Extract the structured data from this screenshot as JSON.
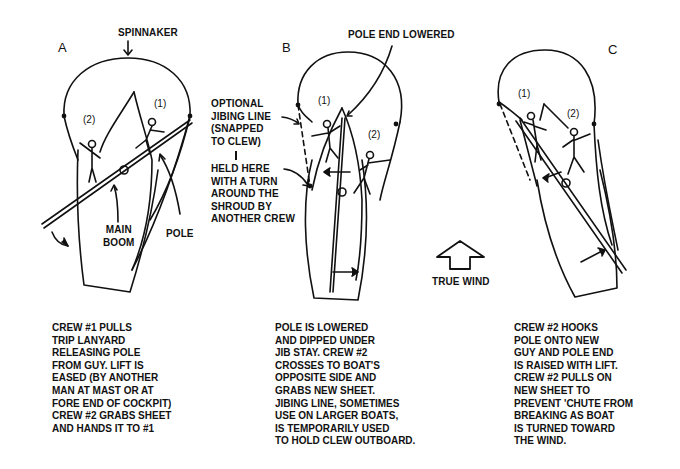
{
  "panels": [
    {
      "letter": "A",
      "labels": {
        "spinnaker": "SPINNAKER",
        "main_boom_1": "MAIN",
        "main_boom_2": "BOOM",
        "pole": "POLE",
        "crew1": "(1)",
        "crew2": "(2)"
      },
      "caption": [
        "CREW #1 PULLS",
        "TRIP LANYARD",
        "RELEASING POLE",
        "FROM GUY. LIFT IS",
        "EASED (BY ANOTHER",
        "MAN AT MAST OR AT",
        "FORE END OF COCKPIT)",
        "CREW #2 GRABS SHEET",
        "AND HANDS IT TO #1"
      ]
    },
    {
      "letter": "B",
      "labels": {
        "pole_end_lowered": "POLE END LOWERED",
        "optional_jibing_line": [
          "OPTIONAL",
          "JIBING LINE",
          "(SNAPPED",
          "TO CLEW)"
        ],
        "held_here": [
          "HELD HERE",
          "WITH A TURN",
          "AROUND THE",
          "SHROUD BY",
          "ANOTHER CREW"
        ],
        "crew1": "(1)",
        "crew2": "(2)"
      },
      "caption": [
        "POLE IS LOWERED",
        "AND DIPPED UNDER",
        "JIB STAY. CREW #2",
        "CROSSES TO BOAT'S",
        "OPPOSITE SIDE AND",
        "GRABS NEW SHEET.",
        "JIBING LINE, SOMETIMES",
        "USE ON LARGER BOATS,",
        "IS TEMPORARILY USED",
        "TO HOLD CLEW OUTBOARD."
      ]
    },
    {
      "letter": "C",
      "labels": {
        "crew1": "(1)",
        "crew2": "(2)"
      },
      "caption": [
        "CREW #2 HOOKS",
        "POLE ONTO NEW",
        "GUY AND POLE END",
        "IS RAISED WITH LIFT.",
        "CREW #2 PULLS ON",
        "NEW SHEET TO",
        "PREVENT 'CHUTE FROM",
        "BREAKING AS BOAT",
        "IS TURNED TOWARD",
        "THE WIND."
      ]
    }
  ],
  "wind_indicator": {
    "label": "TRUE WIND",
    "icon": "up-arrow-outline"
  },
  "colors": {
    "ink": "#111111",
    "background": "#ffffff"
  }
}
